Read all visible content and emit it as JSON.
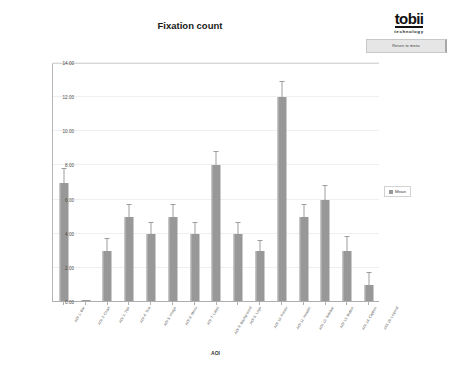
{
  "brand": {
    "logo": "tobii",
    "tagline": "technology",
    "return_button_label": "Return to menu"
  },
  "legend": {
    "entries": [
      "Mean"
    ],
    "position": "right"
  },
  "chart_data": {
    "type": "bar",
    "title": "Fixation count",
    "xlabel": "AOI",
    "ylabel": "Fixation count",
    "ylim": [
      0,
      14
    ],
    "ytick_labels": [
      "0.00",
      "2.00",
      "4.00",
      "6.00",
      "8.00",
      "10.00",
      "12.00",
      "14.00"
    ],
    "ytick_values": [
      0,
      2,
      4,
      6,
      8,
      10,
      12,
      14
    ],
    "grid": true,
    "series_name": "Mean",
    "bar_color": "#989898",
    "categories": [
      "AOI 1: Bar",
      "AOI 2: Chart",
      "AOI 3: Title",
      "AOI 4: Text",
      "AOI 5: Image",
      "AOI 6: Menu",
      "AOI 7: Label",
      "AOI 8: Background",
      "AOI 9: Logo",
      "AOI 10: Footer",
      "AOI 11: Header",
      "AOI 12: Sidebar",
      "AOI 13: Button",
      "AOI 14: Caption",
      "AOI 15: Legend"
    ],
    "values": [
      7.0,
      0.1,
      3.0,
      5.0,
      4.0,
      5.0,
      4.0,
      8.0,
      4.0,
      3.0,
      12.0,
      5.0,
      6.0,
      3.0,
      1.0
    ],
    "errors": [
      0.8,
      0.0,
      0.7,
      0.7,
      0.6,
      0.7,
      0.6,
      0.8,
      0.6,
      0.6,
      0.9,
      0.7,
      0.8,
      0.8,
      0.7
    ]
  }
}
